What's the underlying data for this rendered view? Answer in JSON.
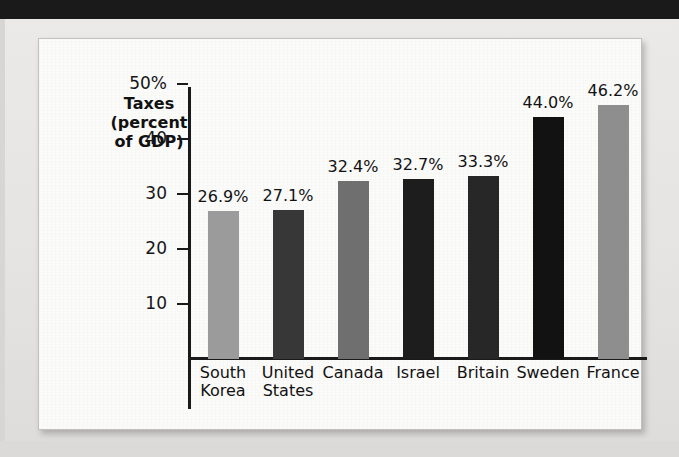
{
  "page": {
    "background_color": "#e8e7e5",
    "panel_color": "#fbfbfa",
    "top_band_color": "#1a1a1a"
  },
  "axis_title": {
    "line1": "Taxes",
    "line2": "(percent",
    "line3": "of GDP)"
  },
  "chart_data": {
    "type": "bar",
    "title": "",
    "xlabel": "",
    "ylabel": "Taxes (percent of GDP)",
    "ylim": [
      0,
      52
    ],
    "grid": false,
    "legend": "none",
    "ytick_labels": [
      "50%",
      "40",
      "30",
      "20",
      "10"
    ],
    "ytick_values": [
      50,
      40,
      30,
      20,
      10
    ],
    "categories": [
      "South Korea",
      "United States",
      "Canada",
      "Israel",
      "Britain",
      "Sweden",
      "France"
    ],
    "category_lines": [
      [
        "South",
        "Korea"
      ],
      [
        "United",
        "States"
      ],
      [
        "Canada",
        ""
      ],
      [
        "Israel",
        ""
      ],
      [
        "Britain",
        ""
      ],
      [
        "Sweden",
        ""
      ],
      [
        "France",
        ""
      ]
    ],
    "values": [
      26.9,
      27.1,
      32.4,
      32.7,
      33.3,
      44.0,
      46.2
    ],
    "value_labels": [
      "26.9%",
      "27.1%",
      "32.4%",
      "32.7%",
      "33.3%",
      "44.0%",
      "46.2%"
    ],
    "bar_colors": [
      "#9b9b9b",
      "#373737",
      "#6f6f6f",
      "#1d1d1d",
      "#272727",
      "#121212",
      "#8e8e8e"
    ]
  }
}
